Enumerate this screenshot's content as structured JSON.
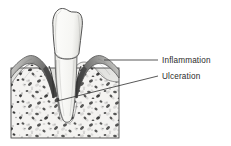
{
  "figure": {
    "background_color": "#ffffff",
    "line_color": "#3a3a3a",
    "text_color": "#2b2b2b",
    "labels": [
      {
        "id": "inflammation",
        "text": "Inflammation",
        "text_x": 162,
        "text_y": 63,
        "leader": {
          "x1": 104,
          "y1": 60,
          "x2": 158,
          "y2": 60
        }
      },
      {
        "id": "ulceration",
        "text": "Ulceration",
        "text_x": 162,
        "text_y": 83,
        "leader": {
          "x1": 57,
          "y1": 101,
          "x2": 158,
          "y2": 76
        }
      }
    ],
    "anatomy": {
      "tooth_crown_fill": "#fcfcfa",
      "tooth_outline": "#4a4a4a",
      "gingiva_fill": "#8d8d8d",
      "gingiva_dark": "#5c5c5c",
      "bone_fill": "#f2f1ef",
      "bone_spicule_color": "#3c3c3c",
      "block_left": 11,
      "block_right": 119,
      "block_top": 68,
      "block_bottom": 138,
      "parts": [
        "tooth-crown",
        "tooth-root",
        "gingiva-left",
        "gingiva-right",
        "periodontal-pocket",
        "alveolar-bone",
        "cortical-plate",
        "bone-block-outline"
      ]
    }
  }
}
